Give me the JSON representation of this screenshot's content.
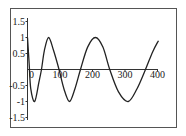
{
  "chart_data": {
    "type": "line",
    "title": "",
    "xlabel": "",
    "ylabel": "",
    "xlim": [
      0,
      400
    ],
    "ylim": [
      -1.5,
      1.5
    ],
    "grid": false,
    "legend": null,
    "x_ticks": [
      "0",
      "100",
      "200",
      "300",
      "400"
    ],
    "y_ticks": [
      "1.5",
      "1",
      "0.5",
      "-0.5",
      "-1",
      "-1.5"
    ],
    "series": [
      {
        "name": "curve",
        "x": [
          0,
          5,
          10,
          22,
          35,
          43,
          52,
          65,
          80,
          97,
          112,
          129,
          146,
          163,
          185,
          209,
          232,
          253,
          280,
          310,
          337,
          363,
          385,
          403
        ],
        "y": [
          1,
          0.2,
          -0.6,
          -1,
          -0.4,
          0,
          0.6,
          1,
          0.6,
          0,
          -0.6,
          -1,
          -0.6,
          0,
          0.7,
          1,
          0.7,
          0,
          -0.7,
          -1,
          -0.6,
          0,
          0.55,
          0.9
        ]
      }
    ]
  },
  "colors": {
    "line": "#222222",
    "frame": "#555555"
  }
}
